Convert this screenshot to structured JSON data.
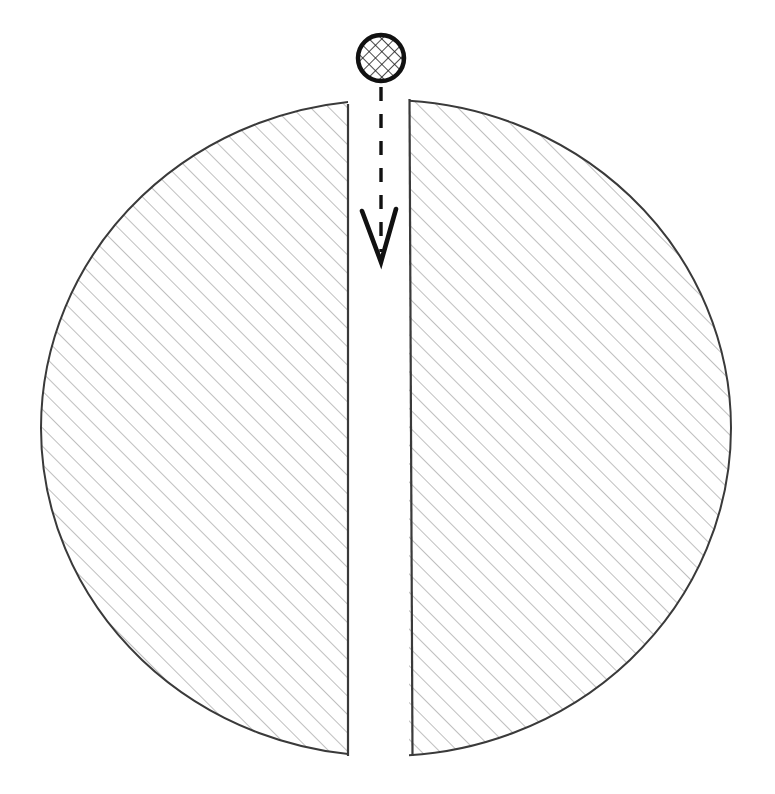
{
  "document": {
    "title": "Sagittal section diagram",
    "background_color": "#ffffff",
    "width": 775,
    "height": 794
  },
  "diagram": {
    "type": "technical-line-drawing",
    "stroke_color": "#3a3a3a",
    "hatch_color": "#8a8a8a",
    "arrow_color": "#111111",
    "fill_color": "#ffffff",
    "outer_circle": {
      "center_x": 386,
      "center_y": 428,
      "radius_x": 345,
      "radius_y": 328,
      "left_edge_x": 41,
      "right_edge_x": 731,
      "top_edge_y": 100,
      "bottom_edge_y": 757
    },
    "gap": {
      "label": "central vertical gap",
      "left_boundary_x": 348,
      "right_boundary_x": 409,
      "width": 61,
      "top_y": 96,
      "bottom_y": 757
    },
    "left_half": {
      "label": "left hatched half-disc",
      "hatch_angle_deg": 45,
      "hatch_spacing": 13,
      "hatch_line_width": 1.1
    },
    "right_half": {
      "label": "right hatched half-disc",
      "hatch_angle_deg": 45,
      "hatch_spacing": 13,
      "hatch_line_width": 1.1
    },
    "marker_circle": {
      "label": "cross-hatched marker circle",
      "center_x": 381,
      "center_y": 58,
      "radius": 25,
      "stroke_width": 4.5,
      "fill_pattern": "cross-hatch",
      "crosshatch_spacing": 9,
      "crosshatch_line_width": 1.6
    },
    "dashed_line": {
      "label": "dashed leader line",
      "x": 381,
      "start_y": 87,
      "end_y": 252,
      "dash_length": 14,
      "dash_gap": 13,
      "stroke_width": 3.4
    },
    "arrow_head": {
      "label": "open chevron arrowhead",
      "left_x": 362,
      "left_y": 211,
      "tip_x": 381,
      "tip_y": 262,
      "right_x": 396,
      "right_y": 209,
      "stroke_width": 4.6
    }
  }
}
